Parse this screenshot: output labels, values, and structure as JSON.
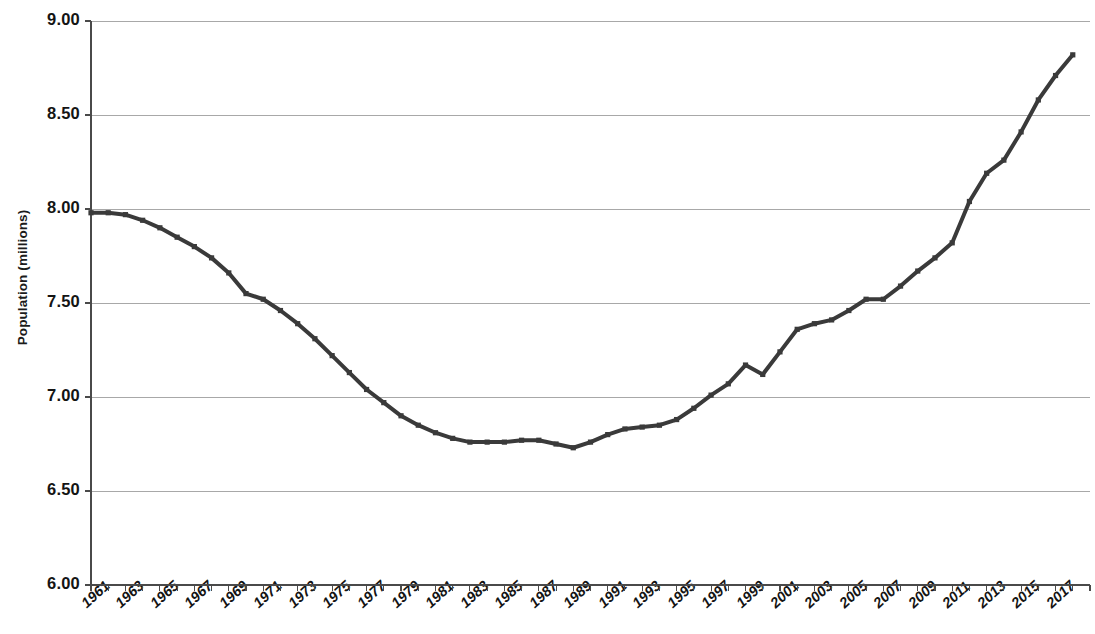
{
  "chart_data": {
    "type": "line",
    "title": "",
    "xlabel": "",
    "ylabel": "Population (millions)",
    "ylim": [
      6.0,
      9.0
    ],
    "ytick_labels": [
      "9.00",
      "8.50",
      "8.00",
      "7.50",
      "7.00",
      "6.50",
      "6.00"
    ],
    "ytick_values": [
      9.0,
      8.5,
      8.0,
      7.5,
      7.0,
      6.5,
      6.0
    ],
    "grid": true,
    "legend": "none",
    "xlim": [
      1961,
      2019
    ],
    "xtick_labels": [
      "1961",
      "1963",
      "1965",
      "1967",
      "1969",
      "1971",
      "1973",
      "1975",
      "1977",
      "1979",
      "1981",
      "1983",
      "1985",
      "1987",
      "1989",
      "1991",
      "1993",
      "1995",
      "1997",
      "1999",
      "2001",
      "2003",
      "2005",
      "2007",
      "2009",
      "2011",
      "2013",
      "2015",
      "2017"
    ],
    "series": [
      {
        "name": "Population",
        "color": "#3a3a3a",
        "x": [
          1961,
          1962,
          1963,
          1964,
          1965,
          1966,
          1967,
          1968,
          1969,
          1970,
          1971,
          1972,
          1973,
          1974,
          1975,
          1976,
          1977,
          1978,
          1979,
          1980,
          1981,
          1982,
          1983,
          1984,
          1985,
          1986,
          1987,
          1988,
          1989,
          1990,
          1991,
          1992,
          1993,
          1994,
          1995,
          1996,
          1997,
          1998,
          1999,
          2000,
          2001,
          2002,
          2003,
          2004,
          2005,
          2006,
          2007,
          2008,
          2009,
          2010,
          2011,
          2012,
          2013,
          2014,
          2015,
          2016,
          2017,
          2018
        ],
        "values": [
          7.98,
          7.98,
          7.97,
          7.94,
          7.9,
          7.85,
          7.8,
          7.74,
          7.66,
          7.55,
          7.52,
          7.46,
          7.39,
          7.31,
          7.22,
          7.13,
          7.04,
          6.97,
          6.9,
          6.85,
          6.81,
          6.78,
          6.76,
          6.76,
          6.76,
          6.77,
          6.77,
          6.75,
          6.73,
          6.76,
          6.8,
          6.83,
          6.84,
          6.85,
          6.88,
          6.94,
          7.01,
          7.07,
          7.17,
          7.12,
          7.24,
          7.36,
          7.39,
          7.41,
          7.46,
          7.52,
          7.52,
          7.59,
          7.67,
          7.74,
          7.82,
          8.04,
          8.19,
          8.26,
          8.41,
          8.58,
          8.71,
          8.82
        ],
        "marker": "square",
        "line_width": 4
      }
    ]
  },
  "axis": {
    "y_axis_title": "Population (millions)"
  },
  "colors": {
    "line": "#3a3a3a",
    "grid": "#a8a8a8",
    "axis": "#4a4a4a",
    "text": "#141414",
    "background": "#ffffff"
  }
}
